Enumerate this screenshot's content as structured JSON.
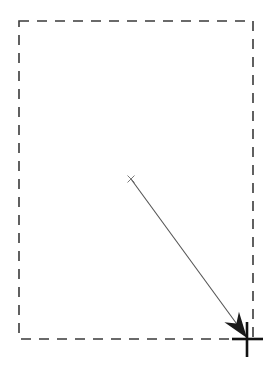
{
  "canvas": {
    "width": 278,
    "height": 368,
    "background": "#ffffff",
    "label": "drag-gesture-annotation"
  },
  "selection_region": {
    "name": "dashed-selection-rectangle",
    "x": 19,
    "y": 21,
    "width": 234,
    "height": 318,
    "stroke_color": "#3a3a3a",
    "stroke_width": 1.6,
    "dash_length": 10,
    "gap_length": 8
  },
  "drag_arrow": {
    "name": "drag-direction-arrow",
    "start_x": 131,
    "start_y": 179,
    "end_x": 247,
    "end_y": 338,
    "stroke_color": "#555555",
    "stroke_width": 1.1,
    "head_length": 26,
    "head_half_width": 9,
    "head_notch": 8,
    "head_color": "#1a1a1a"
  },
  "start_marker": {
    "name": "start-point-x-marker",
    "x": 131,
    "y": 179,
    "arm": 3.2,
    "color": "#6b6b6b",
    "stroke_width": 0.9,
    "glyph": "x-mark"
  },
  "end_marker": {
    "name": "end-point-crosshair-marker",
    "center_x": 247,
    "center_y": 339,
    "h_start_x": 232,
    "h_end_x": 263,
    "v_start_y": 322,
    "v_end_y": 357,
    "color": "#111111",
    "stroke_width": 2.6
  }
}
